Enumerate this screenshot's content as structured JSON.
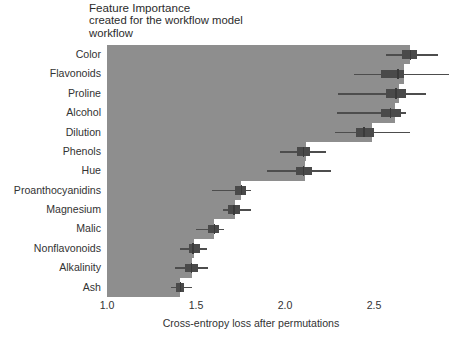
{
  "title": {
    "main": "Feature Importance",
    "sub1": "created for the workflow model",
    "sub2": "workflow"
  },
  "axes": {
    "x_title": "Cross-entropy loss after permutations",
    "x_ticks": [
      "1.0",
      "1.5",
      "2.0",
      "2.5"
    ],
    "x_tick_values": [
      1.0,
      1.5,
      2.0,
      2.5
    ],
    "x_min": 1.0,
    "x_max": 2.72,
    "y_title": ""
  },
  "style": {
    "panel_bg": "#8e8e8e",
    "bar_color": "#8e8e8e",
    "box_color": "#4a4a4a",
    "whisker_color": "#4d4d4d",
    "grid_color": "#ffffff",
    "text_color": "#333333"
  },
  "chart_data": {
    "type": "bar",
    "title": "Feature Importance",
    "subtitle": "created for the workflow model",
    "xlabel": "Cross-entropy loss after permutations",
    "ylabel": "",
    "xlim": [
      1.0,
      2.72
    ],
    "grid": true,
    "legend": "none",
    "orientation": "horizontal",
    "baseline": 1.0,
    "value_label": "Cross-entropy loss after permutations",
    "categories": [
      "Color",
      "Flavonoids",
      "Proline",
      "Alcohol",
      "Dilution",
      "Phenols",
      "Hue",
      "Proanthocyanidins",
      "Magnesium",
      "Malic",
      "Nonflavonoids",
      "Alkalinity",
      "Ash"
    ],
    "values": [
      2.7,
      2.67,
      2.64,
      2.62,
      2.49,
      2.12,
      2.11,
      1.75,
      1.72,
      1.6,
      1.49,
      1.48,
      1.41
    ],
    "series": [
      {
        "name": "Cross-entropy loss after permutations",
        "values": [
          2.7,
          2.67,
          2.64,
          2.62,
          2.49,
          2.12,
          2.11,
          1.75,
          1.72,
          1.6,
          1.49,
          1.48,
          1.41
        ]
      }
    ],
    "boxplots": [
      {
        "category": "Color",
        "whisker_low": 2.57,
        "box_low": 2.66,
        "median": 2.7,
        "box_high": 2.74,
        "whisker_high": 2.86
      },
      {
        "category": "Flavonoids",
        "whisker_low": 2.39,
        "box_low": 2.54,
        "median": 2.63,
        "box_high": 2.67,
        "whisker_high": 2.92
      },
      {
        "category": "Proline",
        "whisker_low": 2.3,
        "box_low": 2.57,
        "median": 2.62,
        "box_high": 2.68,
        "whisker_high": 2.79
      },
      {
        "category": "Alcohol",
        "whisker_low": 2.29,
        "box_low": 2.54,
        "median": 2.59,
        "box_high": 2.65,
        "whisker_high": 2.68
      },
      {
        "category": "Dilution",
        "whisker_low": 2.28,
        "box_low": 2.4,
        "median": 2.44,
        "box_high": 2.5,
        "whisker_high": 2.7
      },
      {
        "category": "Phenols",
        "whisker_low": 1.97,
        "box_low": 2.07,
        "median": 2.1,
        "box_high": 2.14,
        "whisker_high": 2.23
      },
      {
        "category": "Hue",
        "whisker_low": 1.9,
        "box_low": 2.06,
        "median": 2.1,
        "box_high": 2.15,
        "whisker_high": 2.26
      },
      {
        "category": "Proanthocyanidins",
        "whisker_low": 1.59,
        "box_low": 1.72,
        "median": 1.75,
        "box_high": 1.78,
        "whisker_high": 1.81
      },
      {
        "category": "Magnesium",
        "whisker_low": 1.65,
        "box_low": 1.68,
        "median": 1.71,
        "box_high": 1.75,
        "whisker_high": 1.81
      },
      {
        "category": "Malic",
        "whisker_low": 1.5,
        "box_low": 1.57,
        "median": 1.6,
        "box_high": 1.63,
        "whisker_high": 1.66
      },
      {
        "category": "Nonflavonoids",
        "whisker_low": 1.41,
        "box_low": 1.46,
        "median": 1.48,
        "box_high": 1.52,
        "whisker_high": 1.56
      },
      {
        "category": "Alkalinity",
        "whisker_low": 1.38,
        "box_low": 1.44,
        "median": 1.47,
        "box_high": 1.51,
        "whisker_high": 1.57
      },
      {
        "category": "Ash",
        "whisker_low": 1.36,
        "box_low": 1.39,
        "median": 1.41,
        "box_high": 1.43,
        "whisker_high": 1.48
      }
    ]
  }
}
